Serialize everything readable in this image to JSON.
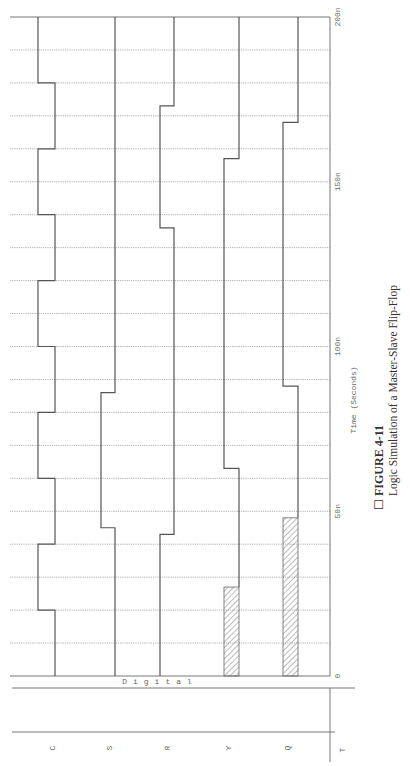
{
  "caption": {
    "marker": "☐",
    "title": "FIGURE 4-11",
    "subtitle": "Logic Simulation of a Master-Slave Flip-Flop"
  },
  "axis": {
    "time_label": "Time (Seconds)",
    "digital_label": "Digital",
    "corner_label": "T",
    "ticks": [
      {
        "t": 0,
        "label": "0"
      },
      {
        "t": 50,
        "label": "50n"
      },
      {
        "t": 100,
        "label": "100n"
      },
      {
        "t": 150,
        "label": "150n"
      },
      {
        "t": 200,
        "label": "200n"
      }
    ]
  },
  "chart_data": {
    "type": "timing",
    "title": "Logic Simulation of a Master-Slave Flip-Flop",
    "xlabel": "Time (Seconds)",
    "ylabel": "Digital",
    "xlim": [
      0,
      200
    ],
    "x_unit": "ns",
    "grid": true,
    "grid_step": 10,
    "orientation": "rotated-90 (time runs bottom to top)",
    "tick_labels": [
      "0",
      "50n",
      "100n",
      "150n",
      "200n"
    ],
    "series": [
      {
        "name": "C",
        "segments": [
          {
            "from": 0,
            "to": 20,
            "value": 0
          },
          {
            "from": 20,
            "to": 40,
            "value": 1
          },
          {
            "from": 40,
            "to": 60,
            "value": 0
          },
          {
            "from": 60,
            "to": 80,
            "value": 1
          },
          {
            "from": 80,
            "to": 100,
            "value": 0
          },
          {
            "from": 100,
            "to": 120,
            "value": 1
          },
          {
            "from": 120,
            "to": 140,
            "value": 0
          },
          {
            "from": 140,
            "to": 160,
            "value": 1
          },
          {
            "from": 160,
            "to": 180,
            "value": 0
          },
          {
            "from": 180,
            "to": 200,
            "value": 1
          }
        ]
      },
      {
        "name": "S",
        "segments": [
          {
            "from": 0,
            "to": 45,
            "value": 0
          },
          {
            "from": 45,
            "to": 86,
            "value": 1
          },
          {
            "from": 86,
            "to": 200,
            "value": 0
          }
        ]
      },
      {
        "name": "R",
        "segments": [
          {
            "from": 0,
            "to": 43,
            "value": 1
          },
          {
            "from": 43,
            "to": 136,
            "value": 0
          },
          {
            "from": 136,
            "to": 173,
            "value": 1
          },
          {
            "from": 173,
            "to": 200,
            "value": 0
          }
        ]
      },
      {
        "name": "Y",
        "segments": [
          {
            "from": 0,
            "to": 27,
            "value": "X"
          },
          {
            "from": 27,
            "to": 63,
            "value": 0
          },
          {
            "from": 63,
            "to": 157,
            "value": 1
          },
          {
            "from": 157,
            "to": 200,
            "value": 0
          }
        ]
      },
      {
        "name": "Q",
        "segments": [
          {
            "from": 0,
            "to": 48,
            "value": "X"
          },
          {
            "from": 48,
            "to": 88,
            "value": 0
          },
          {
            "from": 88,
            "to": 168,
            "value": 1
          },
          {
            "from": 168,
            "to": 200,
            "value": 0
          }
        ]
      }
    ]
  },
  "layout": {
    "y0": 676,
    "y200": 17,
    "grid_x0": 10,
    "grid_x1": 330,
    "signals": [
      {
        "name": "C",
        "low_x": 55,
        "high_x": 38,
        "label_x": 55
      },
      {
        "name": "S",
        "low_x": 115,
        "high_x": 101,
        "label_x": 112
      },
      {
        "name": "R",
        "low_x": 174,
        "high_x": 160,
        "label_x": 170
      },
      {
        "name": "Y",
        "low_x": 239,
        "high_x": 224,
        "label_x": 231
      },
      {
        "name": "Q",
        "low_x": 298,
        "high_x": 283,
        "label_x": 290
      }
    ]
  }
}
